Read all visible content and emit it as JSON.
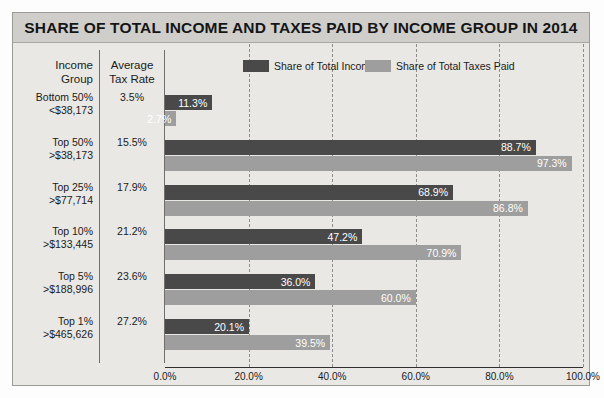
{
  "chart": {
    "title": "SHARE OF TOTAL INCOME AND TAXES PAID BY INCOME GROUP IN 2014",
    "header_income_group_l1": "Income",
    "header_income_group_l2": "Group",
    "header_tax_rate_l1": "Average",
    "header_tax_rate_l2": "Tax Rate"
  },
  "colors": {
    "income_bar": "#494949",
    "taxes_bar": "#9e9e9e",
    "title_band": "#cfcecb",
    "card_background": "#e9e8e4",
    "gridline": "#8d8d8a",
    "axis": "#2f2f2f",
    "text": "#1b1b1b",
    "bar_label_text": "#ffffff"
  },
  "chart_data": {
    "type": "bar",
    "orientation": "horizontal",
    "title": "SHARE OF TOTAL INCOME AND TAXES PAID BY INCOME GROUP IN 2014",
    "xlabel": "",
    "ylabel": "",
    "xlim": [
      0,
      100
    ],
    "grid": true,
    "grid_axis": "x",
    "legend_position": "top",
    "xticks": [
      0,
      20,
      40,
      60,
      80,
      100
    ],
    "xtick_labels": [
      "0.0%",
      "20.0%",
      "40.0%",
      "60.0%",
      "80.0%",
      "100.0%"
    ],
    "categories": [
      "Bottom 50% <$38,173",
      "Top 50% >$38,173",
      "Top 25% >$77,714",
      "Top 10% >$133,445",
      "Top 5% >$188,996",
      "Top 1% >$465,626"
    ],
    "category_rows": [
      {
        "group_l1": "Bottom 50%",
        "group_l2": "<$38,173",
        "avg_tax_rate": "3.5%",
        "income_share": 11.3,
        "taxes_share": 2.7,
        "income_label": "11.3%",
        "taxes_label": "2.7%"
      },
      {
        "group_l1": "Top 50%",
        "group_l2": ">$38,173",
        "avg_tax_rate": "15.5%",
        "income_share": 88.7,
        "taxes_share": 97.3,
        "income_label": "88.7%",
        "taxes_label": "97.3%"
      },
      {
        "group_l1": "Top 25%",
        "group_l2": ">$77,714",
        "avg_tax_rate": "17.9%",
        "income_share": 68.9,
        "taxes_share": 86.8,
        "income_label": "68.9%",
        "taxes_label": "86.8%"
      },
      {
        "group_l1": "Top 10%",
        "group_l2": ">$133,445",
        "avg_tax_rate": "21.2%",
        "income_share": 47.2,
        "taxes_share": 70.9,
        "income_label": "47.2%",
        "taxes_label": "70.9%"
      },
      {
        "group_l1": "Top 5%",
        "group_l2": ">$188,996",
        "avg_tax_rate": "23.6%",
        "income_share": 36.0,
        "taxes_share": 60.0,
        "income_label": "36.0%",
        "taxes_label": "60.0%"
      },
      {
        "group_l1": "Top 1%",
        "group_l2": ">$465,626",
        "avg_tax_rate": "27.2%",
        "income_share": 20.1,
        "taxes_share": 39.5,
        "income_label": "20.1%",
        "taxes_label": "39.5%"
      }
    ],
    "series": [
      {
        "name": "Share of Total Income",
        "values": [
          11.3,
          88.7,
          68.9,
          47.2,
          36.0,
          20.1
        ],
        "color": "#494949"
      },
      {
        "name": "Share of Total Taxes Paid",
        "values": [
          2.7,
          97.3,
          86.8,
          70.9,
          60.0,
          39.5
        ],
        "color": "#9e9e9e"
      }
    ],
    "extra_column": {
      "name": "Average Tax Rate",
      "values": [
        "3.5%",
        "15.5%",
        "17.9%",
        "21.2%",
        "23.6%",
        "27.2%"
      ]
    }
  }
}
